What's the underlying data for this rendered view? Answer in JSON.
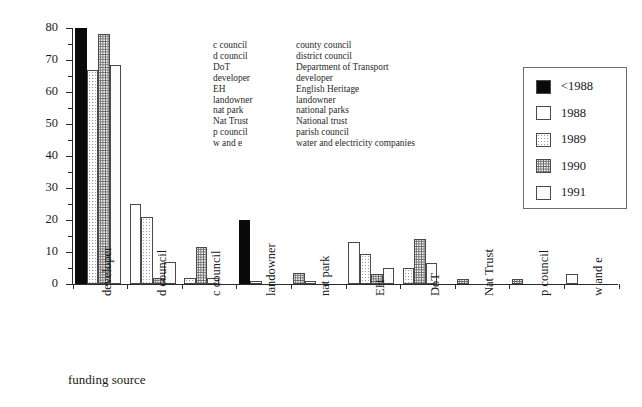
{
  "chart_data": {
    "type": "bar",
    "title": "",
    "xlabel": "funding source",
    "ylabel": "percentage",
    "ylim": [
      0,
      80
    ],
    "yticks": [
      0,
      10,
      20,
      30,
      40,
      50,
      60,
      70,
      80
    ],
    "grid": false,
    "legend_position": "right",
    "categories": [
      "developer",
      "d council",
      "c council",
      "landowner",
      "nat park",
      "EH",
      "DoT",
      "Nat Trust",
      "p council",
      "w and e"
    ],
    "series": [
      {
        "name": "<1988",
        "values": [
          80,
          0,
          0,
          20,
          0,
          0,
          0,
          0,
          0,
          0
        ]
      },
      {
        "name": "1988",
        "values": [
          0,
          25,
          0,
          0,
          0,
          13,
          0,
          0,
          0,
          0
        ]
      },
      {
        "name": "1989",
        "values": [
          67,
          21,
          2,
          0,
          0,
          9.5,
          5,
          0,
          0,
          0
        ]
      },
      {
        "name": "1990",
        "values": [
          78,
          2,
          11.5,
          0,
          3.5,
          3,
          14,
          1.5,
          1.5,
          0
        ]
      },
      {
        "name": "1991",
        "values": [
          68.5,
          7,
          2,
          1,
          1,
          5,
          6.5,
          0,
          0,
          3
        ]
      }
    ]
  },
  "axes": {
    "y_title": "percentage",
    "x_title": "funding source",
    "y_tick_labels": [
      "0",
      "10",
      "20",
      "30",
      "40",
      "50",
      "60",
      "70",
      "80"
    ]
  },
  "abbreviations": {
    "rows": [
      {
        "abbr": "c council",
        "full": "county council"
      },
      {
        "abbr": "d council",
        "full": "district council"
      },
      {
        "abbr": "DoT",
        "full": "Department of Transport"
      },
      {
        "abbr": "developer",
        "full": "developer"
      },
      {
        "abbr": "EH",
        "full": "English Heritage"
      },
      {
        "abbr": "landowner",
        "full": "landowner"
      },
      {
        "abbr": "nat park",
        "full": "national parks"
      },
      {
        "abbr": "Nat Trust",
        "full": "National trust"
      },
      {
        "abbr": "p council",
        "full": "parish council"
      },
      {
        "abbr": "w and e",
        "full": "water and electricity companies"
      }
    ]
  },
  "legend": {
    "entries": [
      {
        "label": "<1988",
        "fill": "black"
      },
      {
        "label": "1988",
        "fill": "white"
      },
      {
        "label": "1989",
        "fill": "dot-light"
      },
      {
        "label": "1990",
        "fill": "dot-dark"
      },
      {
        "label": "1991",
        "fill": "pale"
      }
    ]
  },
  "colors": {
    "axis": "#2b2b2b",
    "bar_outline": "#4a4a4a",
    "series_black": "#0a0a0a",
    "text": "#1a1a1a"
  }
}
